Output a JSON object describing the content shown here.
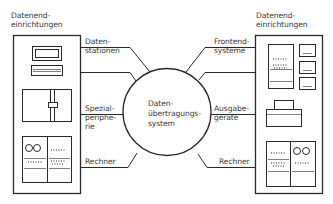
{
  "diagram": {
    "center": {
      "line1": "Daten-",
      "line2": "übertragungs-",
      "line3": "system"
    },
    "left_group": {
      "title_line1": "Datenend-",
      "title_line2": "einrichtungen",
      "connections": [
        {
          "line1": "Daten-",
          "line2": "stationen"
        },
        {
          "line1": "Spezial-",
          "line2": "periphe-",
          "line3": "rie"
        },
        {
          "line1": "Rechner"
        }
      ]
    },
    "right_group": {
      "title_line1": "Datenend-",
      "title_line2": "einrichtungen",
      "connections": [
        {
          "line1": "Frontend-",
          "line2": "systeme"
        },
        {
          "line1": "Ausgabe-",
          "line2": "geräte"
        },
        {
          "line1": "Rechner"
        }
      ]
    },
    "colors": {
      "stroke": "#2a2a2a",
      "background": "#ffffff"
    }
  }
}
